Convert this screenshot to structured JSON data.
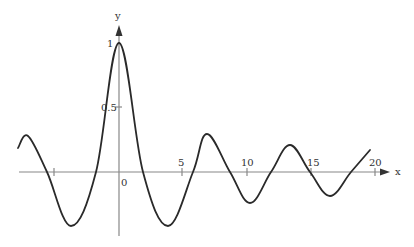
{
  "chart_data": {
    "type": "line",
    "title": "",
    "xlabel": "x",
    "ylabel": "y",
    "function_hint": "sin(x)/x (damped oscillation, stylized)",
    "x_ticks": [
      -5,
      5,
      10,
      15,
      20
    ],
    "x_tick_labels": [
      "",
      "5",
      "10",
      "15",
      "20"
    ],
    "y_ticks": [
      0.5,
      1
    ],
    "y_tick_labels": [
      "0.5",
      "1"
    ],
    "origin_label": "0",
    "xlim": [
      -7.8,
      21.5
    ],
    "ylim": [
      -0.5,
      1.05
    ],
    "grid": false,
    "legend": null,
    "series": [
      {
        "name": "y",
        "x": [
          -7.8,
          -7.0,
          -5.6,
          -3.14,
          -1.8,
          0,
          1.8,
          3.14,
          5.6,
          7.0,
          8.5,
          9.42,
          11.0,
          12.57,
          14.0,
          15.7,
          17.0,
          18.85,
          20.0
        ],
        "y": [
          0.19,
          0.28,
          0.0,
          -0.42,
          0.0,
          1.0,
          0.0,
          -0.42,
          0.0,
          0.29,
          0.0,
          -0.24,
          0.0,
          0.21,
          0.0,
          -0.19,
          0.0,
          0.18,
          0.18
        ]
      }
    ],
    "pixel_path": [
      [
        18,
        148
      ],
      [
        28,
        136
      ],
      [
        47,
        172
      ],
      [
        71,
        226
      ],
      [
        96,
        172
      ],
      [
        119,
        43
      ],
      [
        143,
        172
      ],
      [
        168,
        226
      ],
      [
        193,
        172
      ],
      [
        207,
        134
      ],
      [
        230,
        172
      ],
      [
        250,
        203
      ],
      [
        271,
        172
      ],
      [
        290,
        145
      ],
      [
        310,
        172
      ],
      [
        330,
        196
      ],
      [
        351,
        172
      ],
      [
        370,
        150
      ]
    ]
  },
  "labels": {
    "x_axis": "x",
    "y_axis": "y",
    "origin": "0",
    "y_one": "1",
    "y_half": "0.5",
    "x5": "5",
    "x10": "10",
    "x15": "15",
    "x20": "20"
  }
}
